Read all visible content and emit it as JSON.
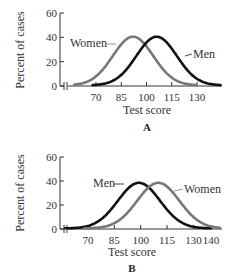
{
  "chart_data": [
    {
      "type": "line",
      "panel": "A",
      "xlabel": "Test score",
      "ylabel": "Percent of cases",
      "xticks": [
        70,
        85,
        100,
        115,
        130
      ],
      "yticks": [
        0,
        20,
        40,
        60
      ],
      "ylim": [
        0,
        60
      ],
      "xlim": [
        55,
        145
      ],
      "axis_break": true,
      "grid": false,
      "legend": "inline labels",
      "series": [
        {
          "name": "Women",
          "color": "#777777",
          "mean": 92,
          "sd": 12,
          "peak": 40,
          "x_start": 57,
          "x_end": 130
        },
        {
          "name": "Men",
          "color": "#111111",
          "mean": 106,
          "sd": 12,
          "peak": 40,
          "x_start": 68,
          "x_end": 144
        }
      ]
    },
    {
      "type": "line",
      "panel": "B",
      "xlabel": "Test score",
      "ylabel": "Percent of cases",
      "xticks": [
        70,
        85,
        100,
        115,
        130,
        140
      ],
      "yticks": [
        0,
        20,
        40,
        60
      ],
      "ylim": [
        0,
        60
      ],
      "xlim": [
        55,
        145
      ],
      "axis_break": true,
      "grid": false,
      "legend": "inline labels",
      "series": [
        {
          "name": "Men",
          "color": "#111111",
          "mean": 99,
          "sd": 12,
          "peak": 38,
          "x_start": 57,
          "x_end": 140
        },
        {
          "name": "Women",
          "color": "#777777",
          "mean": 110,
          "sd": 12,
          "peak": 38,
          "x_start": 68,
          "x_end": 145
        }
      ]
    }
  ],
  "panels": {
    "A": {
      "letter": "A",
      "xlabel": "Test score",
      "ylabel": "Percent of cases",
      "label_left": "Women",
      "label_right": "Men"
    },
    "B": {
      "letter": "B",
      "xlabel": "Test score",
      "ylabel": "Percent of cases",
      "label_left": "Men",
      "label_right": "Women"
    }
  }
}
